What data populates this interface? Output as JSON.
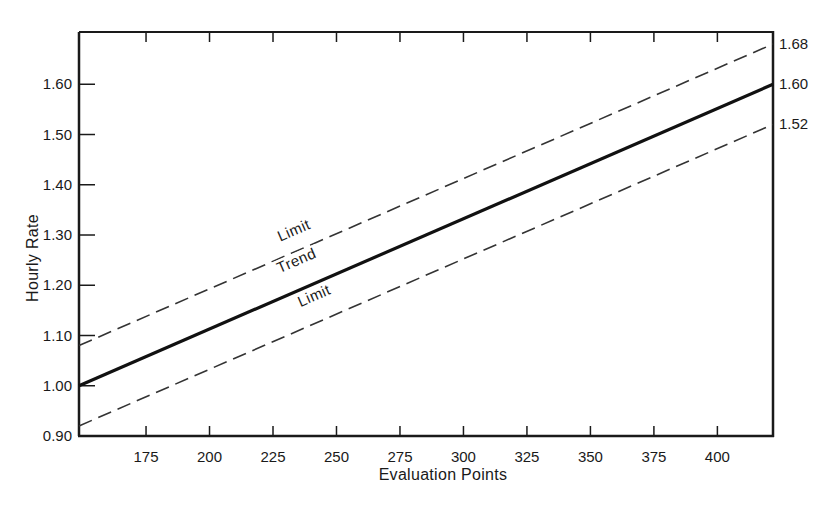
{
  "chart_data": {
    "type": "line",
    "title": "",
    "xlabel": "Evaluation Points",
    "ylabel": "Hourly Rate",
    "xlim": [
      148.6,
      421.9
    ],
    "ylim": [
      0.9,
      1.704
    ],
    "grid": false,
    "legend": "none (inline labels)",
    "x_ticks": [
      175,
      200,
      225,
      250,
      275,
      300,
      325,
      350,
      375,
      400
    ],
    "x_tick_labels": [
      "175",
      "200",
      "225",
      "250",
      "275",
      "300",
      "325",
      "350",
      "375",
      "400"
    ],
    "y_ticks": [
      0.9,
      1.0,
      1.1,
      1.2,
      1.3,
      1.4,
      1.5,
      1.6
    ],
    "y_tick_labels": [
      "0.90",
      "1.00",
      "1.10",
      "1.20",
      "1.30",
      "1.40",
      "1.50",
      "1.60"
    ],
    "right_labels": [
      {
        "value": 1.68,
        "text": "1.68"
      },
      {
        "value": 1.6,
        "text": "1.60"
      },
      {
        "value": 1.52,
        "text": "1.52"
      }
    ],
    "series": [
      {
        "name": "Upper Limit",
        "label": "Limit",
        "style": "dashed",
        "x": [
          148.6,
          421.9
        ],
        "values": [
          1.08,
          1.68
        ]
      },
      {
        "name": "Trend",
        "label": "Trend",
        "style": "solid",
        "x": [
          148.6,
          421.9
        ],
        "values": [
          1.0,
          1.6
        ]
      },
      {
        "name": "Lower Limit",
        "label": "Limit",
        "style": "dashed",
        "x": [
          148.6,
          421.9
        ],
        "values": [
          0.92,
          1.52
        ]
      }
    ],
    "annotations": [
      {
        "text": "Limit",
        "x": 234,
        "y": 1.3,
        "rotation": -23.5,
        "for": "Upper Limit"
      },
      {
        "text": "Trend",
        "x": 235,
        "y": 1.24,
        "rotation": -23.5,
        "for": "Trend"
      },
      {
        "text": "Limit",
        "x": 242,
        "y": 1.17,
        "rotation": -23.5,
        "for": "Lower Limit"
      }
    ],
    "colors": {
      "axis": "#1a1a1a",
      "trend": "#111111",
      "limit": "#333333",
      "background": "#ffffff"
    }
  }
}
